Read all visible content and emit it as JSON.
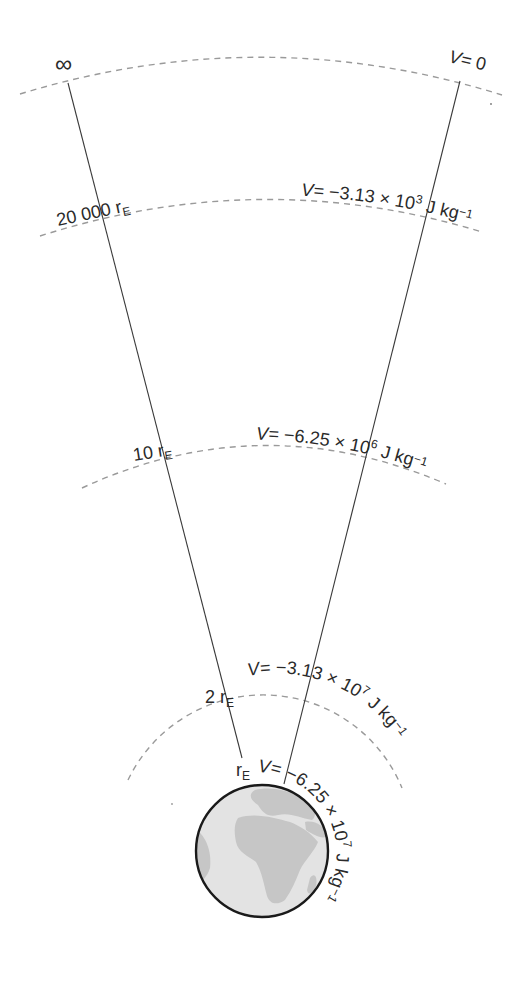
{
  "diagram": {
    "levels": [
      {
        "distance_label": "∞",
        "potential": {
          "prefix": "V= ",
          "value": "0",
          "exponent": "",
          "unit": ""
        }
      },
      {
        "distance_label": {
          "number": "20 000 r",
          "subscript": "E"
        },
        "potential": {
          "prefix": "V= ",
          "value": "−3.13 × 10",
          "exponent": "3",
          "unit": " J kg",
          "unit_exponent": "−1"
        }
      },
      {
        "distance_label": {
          "number": "10 r",
          "subscript": "E"
        },
        "potential": {
          "prefix": "V= ",
          "value": "−6.25 × 10",
          "exponent": "6",
          "unit": " J kg",
          "unit_exponent": "−1"
        }
      },
      {
        "distance_label": {
          "number": "2 r",
          "subscript": "E"
        },
        "potential": {
          "prefix": "V= ",
          "value": "−3.13 × 10",
          "exponent": "7",
          "unit": " J kg",
          "unit_exponent": "−1"
        }
      },
      {
        "distance_label": {
          "number": "r",
          "subscript": "E"
        },
        "potential": {
          "prefix": "V= ",
          "value": "−6.25 × 10",
          "exponent": "7",
          "unit": " J kg",
          "unit_exponent": "−1"
        }
      }
    ],
    "colors": {
      "line": "#3a3a3a",
      "dashed_arc": "#9a9a9a",
      "earth_ocean": "#e2e2e2",
      "earth_land": "#c4c4c4",
      "earth_outline": "#1a1a1a"
    }
  }
}
